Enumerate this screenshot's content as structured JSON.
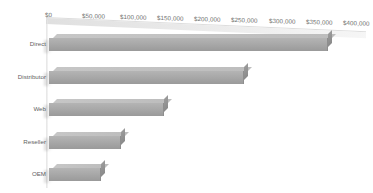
{
  "chart_data": {
    "type": "bar",
    "orientation": "horizontal",
    "title": "",
    "xlabel": "",
    "ylabel": "",
    "categories": [
      "Direct",
      "Distributor",
      "Web",
      "Reseller",
      "OEM"
    ],
    "values": [
      375000,
      262000,
      155000,
      97000,
      70000
    ],
    "xlim": [
      0,
      400000
    ],
    "xticks": [
      0,
      50000,
      100000,
      150000,
      200000,
      250000,
      300000,
      350000,
      400000
    ],
    "xtick_labels": [
      "$0",
      "$50,000",
      "$100,000",
      "$150,000",
      "$200,000",
      "$250,000",
      "$300,000",
      "$350,000",
      "$400,000"
    ],
    "grid": false,
    "legend": false,
    "style": "3d-bar",
    "series": [
      {
        "name": "Sales",
        "values": [
          375000,
          262000,
          155000,
          97000,
          70000
        ]
      }
    ],
    "colors": {
      "bar_face": "#a8a8a8",
      "bar_top": "#c2c2c2",
      "bar_side": "#929292",
      "axis_text": "#6f6f6f",
      "category_text": "#5f5f5f",
      "background": "#ffffff",
      "floor": "#e4e4e4"
    }
  },
  "axis": {
    "ticks": [
      {
        "label": "$0",
        "value": 0
      },
      {
        "label": "$50,000",
        "value": 50000
      },
      {
        "label": "$100,000",
        "value": 100000
      },
      {
        "label": "$150,000",
        "value": 150000
      },
      {
        "label": "$200,000",
        "value": 200000
      },
      {
        "label": "$250,000",
        "value": 250000
      },
      {
        "label": "$300,000",
        "value": 300000
      },
      {
        "label": "$350,000",
        "value": 350000
      },
      {
        "label": "$400,000",
        "value": 400000
      }
    ]
  },
  "categories": [
    {
      "label": "Direct",
      "value": 375000
    },
    {
      "label": "Distributor",
      "value": 262000
    },
    {
      "label": "Web",
      "value": 155000
    },
    {
      "label": "Reseller",
      "value": 97000
    },
    {
      "label": "OEM",
      "value": 70000
    }
  ]
}
